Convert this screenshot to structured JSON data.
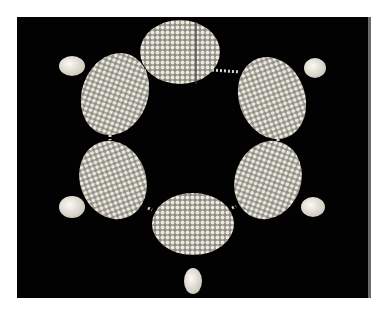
{
  "image": {
    "subject": "pearl necklace with six oval seed-pearl clusters and pear-shaped pearl drops",
    "background_color": "#020202",
    "frame_color": "#ffffff",
    "pearl_color": "#e9e6dc",
    "links": [
      {
        "name": "top-clasp",
        "cx": 180,
        "cy": 52,
        "rx": 40,
        "ry": 33,
        "rot": 0
      },
      {
        "name": "upper-left",
        "cx": 115,
        "cy": 92,
        "rx": 34,
        "ry": 43,
        "rot": 20
      },
      {
        "name": "upper-right",
        "cx": 272,
        "cy": 96,
        "rx": 34,
        "ry": 43,
        "rot": -20
      },
      {
        "name": "lower-left",
        "cx": 113,
        "cy": 178,
        "rx": 33,
        "ry": 41,
        "rot": -20
      },
      {
        "name": "lower-right",
        "cx": 268,
        "cy": 178,
        "rx": 33,
        "ry": 41,
        "rot": 20
      },
      {
        "name": "bottom",
        "cx": 193,
        "cy": 213,
        "rx": 42,
        "ry": 32,
        "rot": 0
      }
    ],
    "drops": [
      {
        "cx": 72,
        "cy": 65
      },
      {
        "cx": 315,
        "cy": 68
      },
      {
        "cx": 72,
        "cy": 190
      },
      {
        "cx": 315,
        "cy": 193
      },
      {
        "cx": 193,
        "cy": 260
      }
    ]
  }
}
